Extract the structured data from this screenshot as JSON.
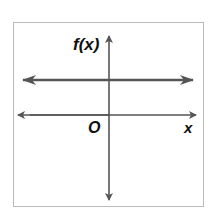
{
  "figure": {
    "type": "coordinate-graph",
    "y_axis_label": "f(x)",
    "x_axis_label": "x",
    "origin_label": "O",
    "function": "constant (horizontal line above x-axis)",
    "colors": {
      "line": "#555555",
      "frame": "#bbbbbb",
      "text": "#111111"
    }
  }
}
